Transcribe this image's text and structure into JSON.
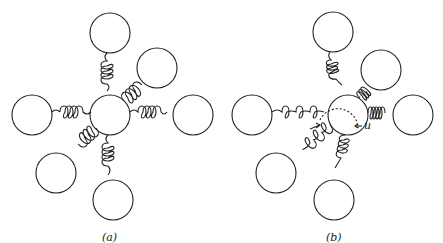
{
  "diagram": {
    "panels": [
      {
        "label": "(a)",
        "state": "equilibrium"
      },
      {
        "label": "(b)",
        "state": "displaced",
        "displacement_label": "u"
      }
    ],
    "stroke_color": "#222222"
  }
}
